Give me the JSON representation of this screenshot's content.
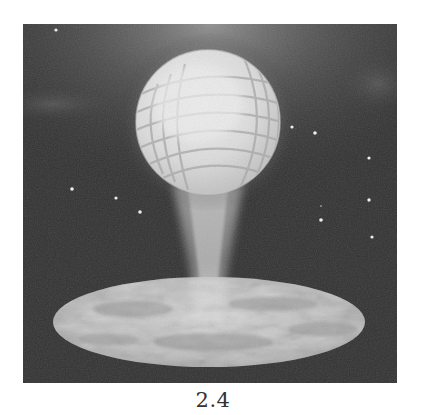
{
  "figure": {
    "caption": "2.4",
    "colors": {
      "background": "#333333",
      "sky_dark": "#2e2e2e",
      "glow": "#bdbdbd",
      "globe_fill": "#e6e6e6",
      "globe_grid": "#9a9a9a",
      "disc_light": "#d0d0d0",
      "disc_dark": "#7a7a7a",
      "star": "#f2f2f2"
    },
    "elements": {
      "globe": {
        "cx": 185,
        "cy": 98,
        "r": 72
      },
      "beam": {
        "top_y": 170,
        "bottom_y": 285
      },
      "disc": {
        "cx": 186,
        "cy": 298,
        "rx": 156,
        "ry": 45
      },
      "stars": [
        {
          "x": 33,
          "y": 6
        },
        {
          "x": 49,
          "y": 165
        },
        {
          "x": 93,
          "y": 174
        },
        {
          "x": 117,
          "y": 188
        },
        {
          "x": 269,
          "y": 103
        },
        {
          "x": 292,
          "y": 109
        },
        {
          "x": 346,
          "y": 134
        },
        {
          "x": 346,
          "y": 176
        },
        {
          "x": 298,
          "y": 196
        },
        {
          "x": 349,
          "y": 213
        },
        {
          "x": 298,
          "y": 182
        }
      ]
    }
  }
}
